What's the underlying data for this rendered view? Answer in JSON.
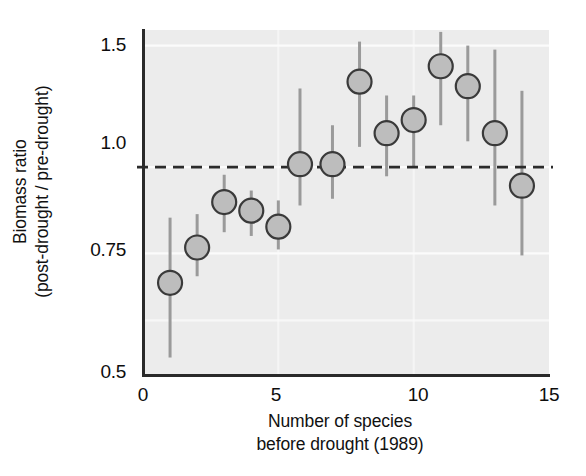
{
  "chart_data": {
    "type": "scatter",
    "title": "",
    "xlabel_lines": [
      "Number of species",
      "before drought (1989)"
    ],
    "ylabel_lines": [
      "Biomass ratio",
      "(post-drought / pre-drought)"
    ],
    "xlabel": "Number of species before drought (1989)",
    "ylabel": "Biomass ratio (post-drought / pre-drought)",
    "xlim": [
      0,
      15
    ],
    "ylim": [
      0.5,
      1.58
    ],
    "yscale": "log",
    "xticks": [
      0,
      5,
      10,
      15
    ],
    "xtick_labels": [
      "0",
      "5",
      "10",
      "15"
    ],
    "yticks": [
      0.5,
      0.75,
      1.0,
      1.5
    ],
    "ytick_labels": [
      "0.5",
      "0.75",
      "1.0",
      "1.5"
    ],
    "grid": "horizontal-white-minor",
    "legend": "none",
    "reference_line": {
      "y": 1.0,
      "style": "dashed",
      "color": "#2b2b2b",
      "label": "no change (ratio = 1.0)"
    },
    "marker": {
      "shape": "circle",
      "fill": "#bdbdbd",
      "edge": "#3a3a3a",
      "radius_px": 12
    },
    "errorbar": {
      "color": "#9a9a9a",
      "width_px": 3,
      "caps": false
    },
    "x": [
      1,
      2,
      3,
      4,
      5,
      5.8,
      7,
      8,
      9,
      10,
      11,
      12,
      13,
      14
    ],
    "values": [
      0.68,
      0.765,
      0.89,
      0.865,
      0.82,
      1.01,
      1.01,
      1.33,
      1.12,
      1.17,
      1.4,
      1.31,
      1.12,
      0.94
    ],
    "y_low": [
      0.53,
      0.695,
      0.805,
      0.795,
      0.76,
      0.88,
      0.9,
      1.07,
      0.97,
      1.0,
      1.15,
      1.09,
      0.88,
      0.745
    ],
    "y_high": [
      0.845,
      0.855,
      0.975,
      0.925,
      0.895,
      1.3,
      1.15,
      1.52,
      1.27,
      1.27,
      1.57,
      1.5,
      1.48,
      1.29
    ],
    "series": [
      {
        "name": "Biomass ratio by species richness",
        "points": [
          {
            "x": 1,
            "y": 0.68,
            "low": 0.53,
            "high": 0.845
          },
          {
            "x": 2,
            "y": 0.765,
            "low": 0.695,
            "high": 0.855
          },
          {
            "x": 3,
            "y": 0.89,
            "low": 0.805,
            "high": 0.975
          },
          {
            "x": 4,
            "y": 0.865,
            "low": 0.795,
            "high": 0.925
          },
          {
            "x": 5,
            "y": 0.82,
            "low": 0.76,
            "high": 0.895
          },
          {
            "x": 5.8,
            "y": 1.01,
            "low": 0.88,
            "high": 1.3
          },
          {
            "x": 7,
            "y": 1.01,
            "low": 0.9,
            "high": 1.15
          },
          {
            "x": 8,
            "y": 1.33,
            "low": 1.07,
            "high": 1.52
          },
          {
            "x": 9,
            "y": 1.12,
            "low": 0.97,
            "high": 1.27
          },
          {
            "x": 10,
            "y": 1.17,
            "low": 1.0,
            "high": 1.27
          },
          {
            "x": 11,
            "y": 1.4,
            "low": 1.15,
            "high": 1.57
          },
          {
            "x": 12,
            "y": 1.31,
            "low": 1.09,
            "high": 1.5
          },
          {
            "x": 13,
            "y": 1.12,
            "low": 0.88,
            "high": 1.48
          },
          {
            "x": 14,
            "y": 0.94,
            "low": 0.745,
            "high": 1.29
          }
        ]
      }
    ]
  },
  "style": {
    "page_background": "#ffffff",
    "plot_background": "#ececec",
    "axis_color": "#2a2a2a",
    "gridline_color": "#fbfbfb",
    "tick_text_color": "#0d0d0d",
    "label_text_color": "#111111"
  }
}
